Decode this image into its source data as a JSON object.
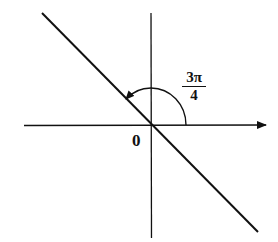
{
  "diagram": {
    "type": "angle-diagram",
    "origin_label": "0",
    "angle_label": {
      "numerator": "3π",
      "denominator": "4"
    },
    "elements": {
      "x_axis": "horizontal axis with arrow pointing right",
      "y_axis": "vertical axis",
      "line": "line through origin at angle 3π/4",
      "arc": "arc with arrow from positive x-axis to line"
    },
    "colors": {
      "stroke": "#111111",
      "background": "#ffffff"
    }
  }
}
